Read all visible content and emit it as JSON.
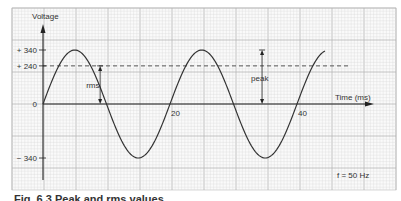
{
  "chart_data": {
    "type": "line",
    "title": "",
    "ylabel": "Voltage",
    "xlabel": "Time (ms)",
    "xlim": [
      0,
      45
    ],
    "ylim": [
      -400,
      420
    ],
    "y_ticks": [
      {
        "value": 340,
        "label": "+ 340"
      },
      {
        "value": 240,
        "label": "+ 240"
      },
      {
        "value": 0,
        "label": "0"
      },
      {
        "value": -340,
        "label": "− 340"
      }
    ],
    "x_ticks": [
      {
        "value": 20,
        "label": "20"
      },
      {
        "value": 40,
        "label": "40"
      }
    ],
    "grid": true,
    "series": [
      {
        "name": "AC voltage",
        "function": "340*sin(2*pi*50*t)",
        "amplitude": 340,
        "frequency_hz": 50,
        "t_range_ms": [
          0,
          44.5
        ],
        "style": "solid"
      },
      {
        "name": "rms level",
        "value": 240,
        "style": "dashed"
      }
    ],
    "annotations": [
      {
        "text": "rms",
        "type": "double-arrow",
        "from": 0,
        "to": 240,
        "at_ms": 9
      },
      {
        "text": "peak",
        "type": "double-arrow",
        "from": 0,
        "to": 340,
        "at_ms": 34.5
      },
      {
        "text": "f = 50 Hz",
        "position": "bottom-right"
      }
    ]
  },
  "caption": "Fig. 6.3 Peak and rms values"
}
